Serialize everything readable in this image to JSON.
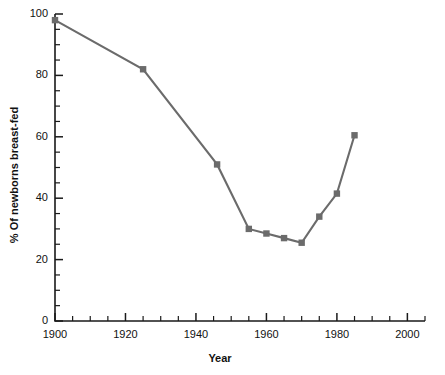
{
  "chart_data": {
    "type": "line",
    "title": "",
    "xlabel": "Year",
    "ylabel": "% Of newborns breast-fed",
    "xlim": [
      1900,
      2005
    ],
    "ylim": [
      0,
      100
    ],
    "grid": false,
    "legend": "none",
    "x_major_ticks": [
      1900,
      1920,
      1940,
      1960,
      1980,
      2000
    ],
    "x_tick_labels": [
      "1900",
      "1920",
      "1940",
      "1960",
      "1980",
      "2000"
    ],
    "x_minor_step": 5,
    "y_major_ticks": [
      0,
      20,
      40,
      60,
      80,
      100
    ],
    "y_tick_labels": [
      "0",
      "20",
      "40",
      "60",
      "80",
      "100"
    ],
    "y_minor_step": 5,
    "series": [
      {
        "name": "% Of newborns breast-fed",
        "color": "#6b6b6b",
        "marker": "square",
        "x": [
          1900,
          1925,
          1946,
          1955,
          1960,
          1965,
          1970,
          1975,
          1980,
          1985
        ],
        "values": [
          98,
          82,
          51,
          30,
          28.5,
          27,
          25.5,
          34,
          41.5,
          60.5
        ]
      }
    ]
  },
  "colors": {
    "line": "#6b6b6b",
    "marker": "#6b6b6b",
    "axis": "#1a1a1a",
    "text": "#111111",
    "background": "#ffffff"
  }
}
